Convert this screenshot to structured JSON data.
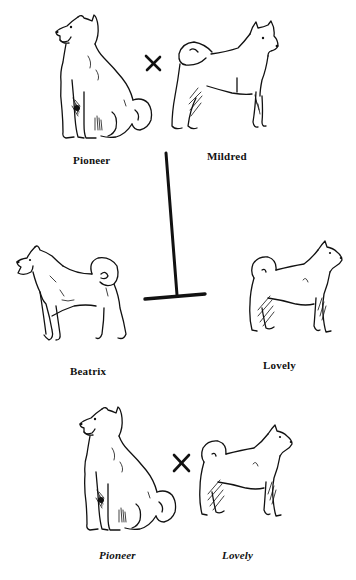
{
  "figure": {
    "type": "breeding-pedigree-diagram",
    "rows": [
      {
        "row": 1,
        "relation": "cross",
        "relation_symbol": "×",
        "left_dog": {
          "name": "Pioneer",
          "pose": "sitting, facing left",
          "label_style": "regular"
        },
        "right_dog": {
          "name": "Mildred",
          "pose": "standing, facing right, curled tail",
          "label_style": "regular"
        }
      },
      {
        "row": 2,
        "relation": "offspring",
        "relation_symbol": "T-bar descent line",
        "left_dog": {
          "name": "Beatrix",
          "pose": "standing, facing left, curled tail",
          "label_style": "regular"
        },
        "right_dog": {
          "name": "Lovely",
          "pose": "standing, facing right, curled tail",
          "label_style": "regular"
        }
      },
      {
        "row": 3,
        "relation": "cross",
        "relation_symbol": "×",
        "left_dog": {
          "name": "Pioneer",
          "pose": "sitting, facing left",
          "label_style": "italic"
        },
        "right_dog": {
          "name": "Lovely",
          "pose": "standing, facing right, curled tail",
          "label_style": "italic"
        }
      }
    ]
  },
  "labels": {
    "row1_left": "Pioneer",
    "row1_right": "Mildred",
    "row2_left": "Beatrix",
    "row2_right": "Lovely",
    "row3_left": "Pioneer",
    "row3_right": "Lovely"
  },
  "symbols": {
    "cross": "×",
    "descent": "T-bar"
  },
  "colors": {
    "ink": "#111111",
    "background": "#ffffff"
  }
}
